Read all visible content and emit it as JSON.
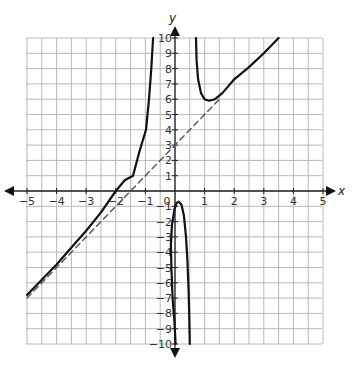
{
  "chart_data": {
    "type": "line",
    "title": "",
    "xlabel": "x",
    "ylabel": "y",
    "xlim": [
      -5,
      5
    ],
    "ylim": [
      -10,
      10
    ],
    "grid": true,
    "grid_step_x": 0.5,
    "grid_step_y": 1,
    "x_ticks": [
      -5,
      -4,
      -3,
      -2,
      -1,
      0,
      1,
      2,
      3,
      4,
      5
    ],
    "y_ticks": [
      -10,
      -9,
      -8,
      -7,
      -6,
      -5,
      -4,
      -3,
      -2,
      -1,
      1,
      2,
      3,
      4,
      5,
      6,
      7,
      8,
      9,
      10
    ],
    "series": [
      {
        "name": "curve-left-branch",
        "style": "solid",
        "points": [
          [
            -5,
            -6.8
          ],
          [
            -4.5,
            -5.8
          ],
          [
            -4,
            -4.8
          ],
          [
            -3.5,
            -3.7
          ],
          [
            -3,
            -2.6
          ],
          [
            -2.5,
            -1.4
          ],
          [
            -2,
            0
          ],
          [
            -1.7,
            0.7
          ],
          [
            -1.42,
            1.0
          ],
          [
            -1.2,
            2.6
          ],
          [
            -0.98,
            4.0
          ],
          [
            -0.88,
            6.0
          ],
          [
            -0.8,
            8.0
          ],
          [
            -0.74,
            10
          ]
        ]
      },
      {
        "name": "curve-middle-branch",
        "style": "solid",
        "points": [
          [
            0.02,
            -10
          ],
          [
            -0.02,
            -8.5
          ],
          [
            -0.08,
            -7
          ],
          [
            -0.12,
            -5
          ],
          [
            -0.14,
            -3.5
          ],
          [
            -0.1,
            -2.2
          ],
          [
            -0.02,
            -1.2
          ],
          [
            0.05,
            -0.8
          ],
          [
            0.13,
            -0.7
          ],
          [
            0.22,
            -0.9
          ],
          [
            0.3,
            -1.6
          ],
          [
            0.37,
            -3
          ],
          [
            0.42,
            -4.5
          ],
          [
            0.46,
            -6.5
          ],
          [
            0.48,
            -8
          ],
          [
            0.5,
            -10
          ]
        ]
      },
      {
        "name": "curve-right-branch",
        "style": "solid",
        "points": [
          [
            0.71,
            10
          ],
          [
            0.73,
            8.5
          ],
          [
            0.78,
            7.3
          ],
          [
            0.88,
            6.4
          ],
          [
            1.0,
            6.0
          ],
          [
            1.15,
            5.9
          ],
          [
            1.35,
            6.0
          ],
          [
            1.6,
            6.4
          ],
          [
            2.0,
            7.3
          ],
          [
            2.5,
            8.1
          ],
          [
            3.0,
            9.0
          ],
          [
            3.5,
            10
          ]
        ]
      },
      {
        "name": "slant-asymptote",
        "style": "dashed",
        "equation": "y = 2x + 3",
        "points": [
          [
            -5,
            -7
          ],
          [
            1.5,
            6
          ]
        ]
      }
    ]
  },
  "axes": {
    "x_label": "x",
    "y_label": "y",
    "origin_label": "0"
  }
}
